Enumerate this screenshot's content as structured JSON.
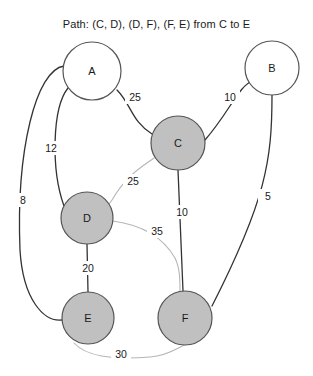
{
  "figure": {
    "title": "Path: (C, D), (D, F), (F, E) from C to E",
    "background": "#ffffff",
    "width": 313,
    "height": 376
  },
  "style": {
    "node_fill_visited": "#c0c0c0",
    "node_fill_unvisited": "#ffffff",
    "node_stroke": "#555555",
    "edge_color_normal": "#333333",
    "edge_color_path": "#b5b5b5",
    "text_color": "#1a1a1a"
  },
  "chart_data": {
    "type": "diagram",
    "title": "Path: (C, D), (D, F), (F, E) from C to E",
    "path": [
      "C",
      "D",
      "F",
      "E"
    ],
    "path_edges": [
      [
        "C",
        "D"
      ],
      [
        "D",
        "F"
      ],
      [
        "F",
        "E"
      ]
    ],
    "start": "C",
    "end": "E",
    "nodes": [
      {
        "id": "A",
        "label": "A",
        "cx": 92,
        "cy": 71,
        "r": 29,
        "filled": false
      },
      {
        "id": "B",
        "label": "B",
        "cx": 272,
        "cy": 68,
        "r": 27,
        "filled": false
      },
      {
        "id": "C",
        "label": "C",
        "cx": 178,
        "cy": 143,
        "r": 27,
        "filled": true
      },
      {
        "id": "D",
        "label": "D",
        "cx": 87,
        "cy": 218,
        "r": 26,
        "filled": true
      },
      {
        "id": "E",
        "label": "E",
        "cx": 88,
        "cy": 318,
        "r": 26,
        "filled": true
      },
      {
        "id": "F",
        "label": "F",
        "cx": 185,
        "cy": 318,
        "r": 27,
        "filled": true
      }
    ],
    "edges": [
      {
        "from": "A",
        "to": "C",
        "weight": 25,
        "label_x": 135,
        "label_y": 97,
        "on_path": false
      },
      {
        "from": "B",
        "to": "C",
        "weight": 10,
        "label_x": 230,
        "label_y": 97,
        "on_path": false
      },
      {
        "from": "A",
        "to": "D",
        "weight": 12,
        "label_x": 51,
        "label_y": 148,
        "on_path": false
      },
      {
        "from": "A",
        "to": "E",
        "weight": 8,
        "label_x": 23,
        "label_y": 200,
        "on_path": false
      },
      {
        "from": "B",
        "to": "F",
        "weight": 5,
        "label_x": 268,
        "label_y": 196,
        "on_path": false
      },
      {
        "from": "C",
        "to": "D",
        "weight": 25,
        "label_x": 133,
        "label_y": 181,
        "on_path": true
      },
      {
        "from": "C",
        "to": "F",
        "weight": 10,
        "label_x": 182,
        "label_y": 212,
        "on_path": false
      },
      {
        "from": "D",
        "to": "F",
        "weight": 35,
        "label_x": 157,
        "label_y": 231,
        "on_path": true
      },
      {
        "from": "D",
        "to": "E",
        "weight": 20,
        "label_x": 88,
        "label_y": 268,
        "on_path": false
      },
      {
        "from": "E",
        "to": "F",
        "weight": 30,
        "label_x": 121,
        "label_y": 354,
        "on_path": true
      }
    ],
    "edge_paths": {
      "A-C": "M 117,90 C 131,104 132,122 152,134",
      "B-C": "M 254,80 C 238,86 231,110 205,140",
      "A-D": "M 68,88 C 52,108 51,170 64,206",
      "A-E": "M 64,66 C 36,70 16,150 20,250 C 23,300 44,322 62,320",
      "B-F": "M 272,95 C 272,160 266,200 212,306",
      "C-D": "M 154,158 C 140,168 126,176 112,200 C 106,208 104,212 113,215",
      "C-F": "M 178,170 L 183,291",
      "D-F": "M 113,221 C 135,224 160,232 175,258 C 180,268 180,280 180,291",
      "D-E": "M 87,244 L 88,292",
      "E-F": "M 74,343 C 86,356 110,360 150,357 C 172,355 182,344 188,344"
    }
  }
}
